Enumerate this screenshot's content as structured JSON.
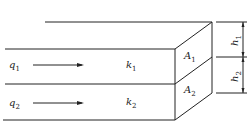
{
  "diagram": {
    "type": "layered-flow-block",
    "layers": [
      {
        "flow": "q",
        "flow_sub": "1",
        "perm": "k",
        "perm_sub": "1",
        "area": "A",
        "area_sub": "1",
        "height": "h",
        "height_sub": "1"
      },
      {
        "flow": "q",
        "flow_sub": "2",
        "perm": "k",
        "perm_sub": "2",
        "area": "A",
        "area_sub": "2",
        "height": "h",
        "height_sub": "2"
      }
    ]
  }
}
